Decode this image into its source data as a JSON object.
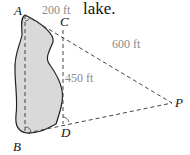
{
  "caption": "lake.",
  "points": {
    "A": {
      "label": "A",
      "x": 25,
      "y": 15
    },
    "B": {
      "label": "B",
      "x": 27,
      "y": 133
    },
    "C": {
      "label": "C",
      "x": 63,
      "y": 30
    },
    "D": {
      "label": "D",
      "x": 63,
      "y": 124
    },
    "P": {
      "label": "P",
      "x": 172,
      "y": 103
    }
  },
  "measurements": {
    "AC": "200 ft",
    "CP": "600 ft",
    "CD": "450 ft"
  },
  "colors": {
    "lake_fill": "#d9d9d9",
    "outline": "#222222",
    "dash": "#444444",
    "dim_text": "#8a8a8a"
  }
}
